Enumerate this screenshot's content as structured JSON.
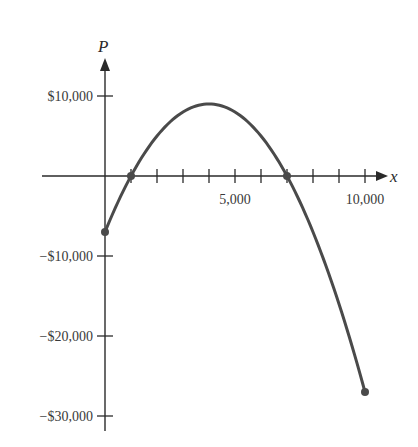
{
  "chart_data": {
    "type": "line",
    "title": "",
    "xlabel": "x",
    "ylabel": "P",
    "function": "P = -0.001x^2 + 8x - 7000",
    "xlim": [
      0,
      10000
    ],
    "ylim": [
      -30000,
      10000
    ],
    "grid": false,
    "legend": null,
    "x_ticks": [
      1000,
      2000,
      3000,
      4000,
      5000,
      6000,
      7000,
      8000,
      9000,
      10000
    ],
    "x_tick_labels": [
      {
        "value": 5000,
        "label": "5,000"
      },
      {
        "value": 10000,
        "label": "10,000"
      }
    ],
    "y_ticks": [
      10000,
      -10000,
      -20000,
      -30000
    ],
    "y_tick_labels": [
      {
        "value": 10000,
        "label": "$10,000"
      },
      {
        "value": -10000,
        "label": "−$10,000"
      },
      {
        "value": -20000,
        "label": "−$20,000"
      },
      {
        "value": -30000,
        "label": "−$30,000"
      }
    ],
    "series": [
      {
        "name": "Profit P(x)",
        "x": [
          0,
          1000,
          2000,
          3000,
          4000,
          5000,
          6000,
          7000,
          8000,
          9000,
          10000
        ],
        "values": [
          -7000,
          0,
          5000,
          8000,
          9000,
          8000,
          5000,
          0,
          -7000,
          -16000,
          -27000
        ]
      }
    ],
    "marked_points": [
      {
        "x": 0,
        "y": -7000
      },
      {
        "x": 1000,
        "y": 0
      },
      {
        "x": 7000,
        "y": 0
      },
      {
        "x": 10000,
        "y": -27000
      }
    ],
    "colors": {
      "curve": "#4a4a4a",
      "axis": "#2a2a2a",
      "text": "#3a3a3a"
    }
  }
}
